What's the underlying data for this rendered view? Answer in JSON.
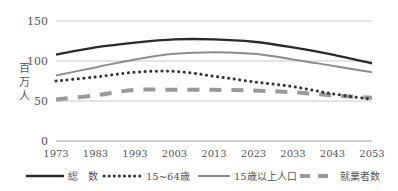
{
  "chart_data": {
    "type": "line",
    "title": "",
    "xlabel": "",
    "ylabel": "百万人",
    "ylim": [
      0,
      150
    ],
    "yticks": [
      0,
      50,
      100,
      150
    ],
    "grid": true,
    "legend_position": "bottom",
    "x": [
      1973,
      1983,
      1993,
      2003,
      2013,
      2023,
      2033,
      2043,
      2053
    ],
    "series": [
      {
        "name": "総　数",
        "style": "solid",
        "color": "#2a2a2a",
        "width": 2.4,
        "values": [
          108,
          117,
          123,
          127,
          127,
          124,
          117,
          108,
          97
        ]
      },
      {
        "name": "15~64歳",
        "style": "dotted",
        "color": "#333333",
        "width": 3,
        "values": [
          75,
          80,
          86,
          87,
          81,
          74,
          68,
          59,
          52
        ]
      },
      {
        "name": "15歳以上人口",
        "style": "solid",
        "color": "#8c8c8c",
        "width": 2,
        "values": [
          82,
          92,
          102,
          109,
          111,
          109,
          102,
          94,
          86
        ]
      },
      {
        "name": "就業者数",
        "style": "dashed",
        "color": "#999999",
        "width": 4,
        "values": [
          52,
          57,
          64,
          64,
          64,
          63,
          61,
          57,
          54
        ]
      }
    ]
  },
  "axis": {
    "ylabel_chars": [
      "百",
      "万",
      "人"
    ]
  }
}
